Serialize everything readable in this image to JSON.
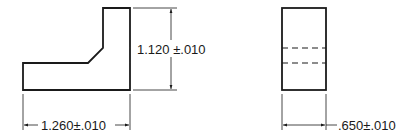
{
  "drawing": {
    "colors": {
      "line": "#1a1a1a",
      "background": "#ffffff"
    },
    "front_view": {
      "height_dimension": {
        "label": "1.120 ±.010"
      },
      "width_dimension": {
        "label": "1.260±.010"
      }
    },
    "side_view": {
      "width_dimension": {
        "label": ".650±.010"
      },
      "hidden_lines": 2
    }
  }
}
